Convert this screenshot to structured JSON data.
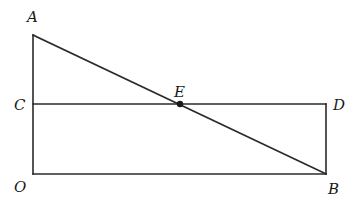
{
  "diagram": {
    "type": "geometry",
    "points": {
      "A": {
        "label": "A",
        "x": 33,
        "y": 35
      },
      "C": {
        "label": "C",
        "x": 33,
        "y": 104
      },
      "O": {
        "label": "O",
        "x": 33,
        "y": 174
      },
      "D": {
        "label": "D",
        "x": 326,
        "y": 104
      },
      "B": {
        "label": "B",
        "x": 326,
        "y": 174
      },
      "E": {
        "label": "E",
        "x": 180,
        "y": 104
      }
    },
    "segments": [
      "AO",
      "OB",
      "BD",
      "CD",
      "AB"
    ],
    "marked_points": [
      "E"
    ],
    "stroke_color": "#2a2a2a"
  }
}
